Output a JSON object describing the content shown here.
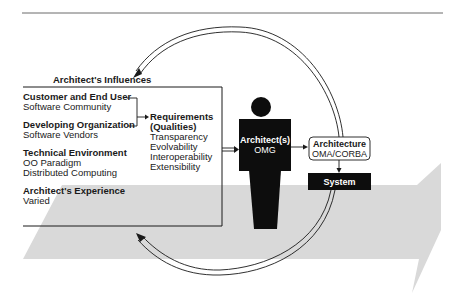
{
  "diagram": {
    "title": "Architect's Influences",
    "influences": [
      {
        "heading": "Customer and End User",
        "detail": [
          "Software Community"
        ]
      },
      {
        "heading": "Developing Organization",
        "detail": [
          "Software Vendors"
        ]
      },
      {
        "heading": "Technical Environment",
        "detail": [
          "OO Paradigm",
          "Distributed Computing"
        ]
      },
      {
        "heading": "Architect's Experience",
        "detail": [
          "Varied"
        ]
      }
    ],
    "requirements": {
      "heading_line1": "Requirements",
      "heading_line2": "(Qualities)",
      "items": [
        "Transparency",
        "Evolvability",
        "Interoperability",
        "Extensibility"
      ]
    },
    "architect": {
      "label": "Architect(s)",
      "sublabel": "OMG"
    },
    "architecture": {
      "label": "Architecture",
      "sublabel": "OMA/CORBA"
    },
    "system": {
      "label": "System"
    },
    "colors": {
      "ink": "#1a1a1a",
      "band": "#d9d9d9",
      "background": "#ffffff"
    }
  }
}
